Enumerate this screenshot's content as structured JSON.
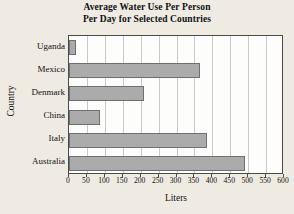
{
  "chart_data": {
    "type": "bar",
    "orientation": "horizontal",
    "title": "Average Water Use Per Person Per Day for Selected Countries",
    "title_lines": [
      "Average Water Use Per Person",
      "Per Day for Selected Countries"
    ],
    "xlabel": "Liters",
    "ylabel": "Country",
    "categories": [
      "Uganda",
      "Mexico",
      "Denmark",
      "China",
      "Italy",
      "Australia"
    ],
    "values": [
      20,
      365,
      210,
      87,
      385,
      490
    ],
    "xlim": [
      0,
      600
    ],
    "xticks": [
      0,
      50,
      100,
      150,
      200,
      250,
      300,
      350,
      400,
      450,
      500,
      550,
      600
    ],
    "xtick_labels": [
      "0",
      "50",
      "100",
      "150",
      "200",
      "250",
      "300",
      "350",
      "400",
      "450",
      "500",
      "550",
      "600"
    ],
    "grid": "vertical",
    "legend": null,
    "bar_color": "#ababab",
    "bar_edge_color": "#6f6f6f",
    "plot_background": "#fdfdfb",
    "figure_background": "#efebe3",
    "axis_color": "#4a4a4a",
    "gridline_color": "#c9c9c9"
  }
}
